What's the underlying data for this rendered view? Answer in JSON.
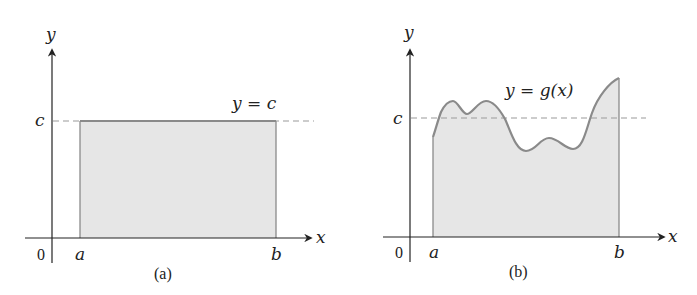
{
  "figure": {
    "panels": [
      {
        "id": "a",
        "caption": "(a)",
        "axis_labels": {
          "x": "x",
          "y": "y"
        },
        "origin_label": "0",
        "tick_labels": {
          "a": "a",
          "b": "b",
          "c": "c"
        },
        "curve_label": "y = c",
        "curve_type": "constant",
        "colors": {
          "fill": "#e6e6e6",
          "curve": "#8a8a8a",
          "dashed": "#9a9a9a",
          "axis": "#222222"
        }
      },
      {
        "id": "b",
        "caption": "(b)",
        "axis_labels": {
          "x": "x",
          "y": "y"
        },
        "origin_label": "0",
        "tick_labels": {
          "a": "a",
          "b": "b",
          "c": "c"
        },
        "curve_label": "y = g(x)",
        "curve_type": "wavy",
        "colors": {
          "fill": "#e6e6e6",
          "curve": "#8a8a8a",
          "dashed": "#9a9a9a",
          "axis": "#222222"
        }
      }
    ]
  }
}
